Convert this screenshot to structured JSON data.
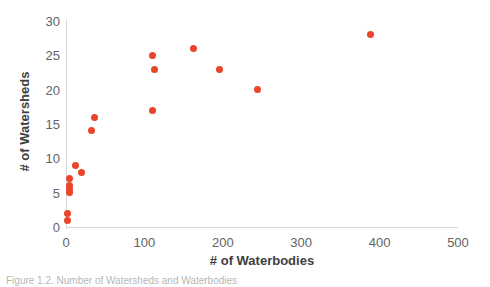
{
  "chart_data": {
    "type": "scatter",
    "title": "",
    "xlabel": "# of Waterbodies",
    "ylabel": "# of Watersheds",
    "xlim": [
      0,
      500
    ],
    "ylim": [
      0,
      30
    ],
    "xticks": [
      0,
      100,
      200,
      300,
      400,
      500
    ],
    "yticks": [
      0,
      5,
      10,
      15,
      20,
      25,
      30
    ],
    "grid": false,
    "legend": null,
    "marker_color": "#e8452a",
    "series": [
      {
        "name": "watersheds-vs-waterbodies",
        "points": [
          {
            "x": 2,
            "y": 1
          },
          {
            "x": 2,
            "y": 2
          },
          {
            "x": 4,
            "y": 5
          },
          {
            "x": 4,
            "y": 5.5
          },
          {
            "x": 5,
            "y": 6
          },
          {
            "x": 4,
            "y": 7
          },
          {
            "x": 12,
            "y": 9
          },
          {
            "x": 20,
            "y": 8
          },
          {
            "x": 33,
            "y": 14
          },
          {
            "x": 36,
            "y": 16
          },
          {
            "x": 110,
            "y": 17
          },
          {
            "x": 113,
            "y": 23
          },
          {
            "x": 110,
            "y": 25
          },
          {
            "x": 163,
            "y": 26
          },
          {
            "x": 196,
            "y": 23
          },
          {
            "x": 244,
            "y": 20
          },
          {
            "x": 389,
            "y": 28
          }
        ]
      }
    ]
  },
  "axes": {
    "x_title": "# of Waterbodies",
    "y_title": "# of Watersheds",
    "x_tick_labels": [
      "0",
      "100",
      "200",
      "300",
      "400",
      "500"
    ],
    "y_tick_labels": [
      "0",
      "5",
      "10",
      "15",
      "20",
      "25",
      "30"
    ]
  },
  "caption": {
    "text": "Figure 1.2. Number of Watersheds and Waterbodies"
  },
  "colors": {
    "marker": "#e8452a",
    "axis_line": "#d9d9d9",
    "tick_label": "#636363",
    "axis_title": "#404040",
    "background": "#ffffff"
  }
}
